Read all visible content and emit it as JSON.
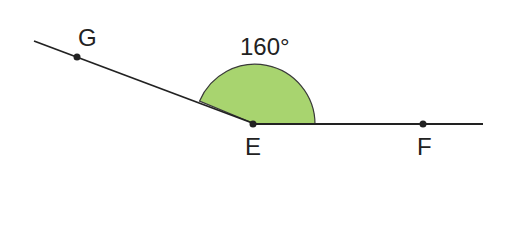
{
  "diagram": {
    "angle_label": "160°",
    "points": [
      {
        "name": "G",
        "x": 77,
        "y": 57
      },
      {
        "name": "E",
        "x": 255,
        "y": 124
      },
      {
        "name": "F",
        "x": 423,
        "y": 124
      }
    ],
    "colors": {
      "fill": "#a8d46f",
      "line": "#222222"
    },
    "angle_degrees": 160
  }
}
